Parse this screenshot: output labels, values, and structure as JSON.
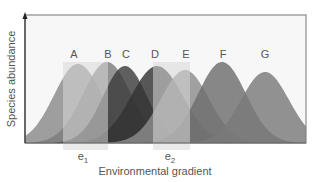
{
  "diagram": {
    "y_axis_label": "Species abundance",
    "x_axis_label": "Environmental gradient",
    "frame": {
      "x1": 25,
      "y1": 15,
      "x2": 306,
      "y2": 143,
      "bg": "#f7f7f7",
      "stroke": "#888888"
    },
    "species": [
      {
        "label": "A",
        "peak_x": 78,
        "peak_y": 64,
        "width": 24,
        "color": "#8a8a8a",
        "label_x": 74,
        "label_y": 58
      },
      {
        "label": "B",
        "peak_x": 107,
        "peak_y": 62,
        "width": 24,
        "color": "#7d7d7d",
        "label_x": 108,
        "label_y": 58
      },
      {
        "label": "C",
        "peak_x": 125,
        "peak_y": 66,
        "width": 22,
        "color": "#3d3d3d",
        "label_x": 126,
        "label_y": 58
      },
      {
        "label": "D",
        "peak_x": 157,
        "peak_y": 66,
        "width": 26,
        "color": "#333333",
        "label_x": 155,
        "label_y": 58
      },
      {
        "label": "E",
        "peak_x": 185,
        "peak_y": 70,
        "width": 24,
        "color": "#8c8c8c",
        "label_x": 186,
        "label_y": 58
      },
      {
        "label": "F",
        "peak_x": 222,
        "peak_y": 62,
        "width": 24,
        "color": "#6e6e6e",
        "label_x": 223,
        "label_y": 58
      },
      {
        "label": "G",
        "peak_x": 265,
        "peak_y": 72,
        "width": 24,
        "color": "#7a7a7a",
        "label_x": 265,
        "label_y": 58
      }
    ],
    "environments": [
      {
        "label": "e",
        "subscript": "1",
        "x": 63,
        "width": 45,
        "label_x": 83,
        "label_y": 160
      },
      {
        "label": "e",
        "subscript": "2",
        "x": 153,
        "width": 37,
        "label_x": 170,
        "label_y": 160
      }
    ]
  }
}
